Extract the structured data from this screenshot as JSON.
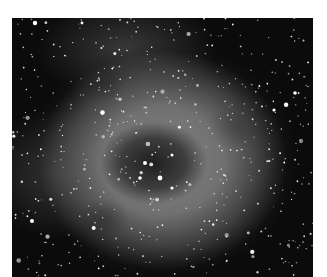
{
  "image": {
    "subject": "grayscale astronomical photograph of a rose-shaped emission nebula with a dark central cavity and a dense star field",
    "colors": {
      "background": "#ffffff",
      "space": "#0b0b0b",
      "nebula": "#828282",
      "cavity": "#1e1e1e",
      "stars": "#ffffff"
    }
  }
}
